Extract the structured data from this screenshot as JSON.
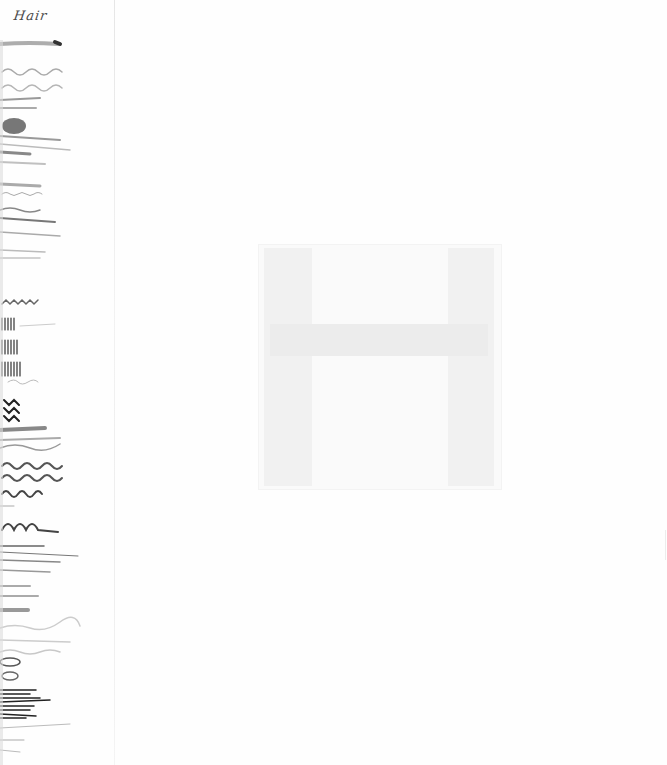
{
  "page": {
    "title": "Hair",
    "background_color": "#fefefe",
    "ink_color": "#4a4a4a"
  },
  "stroke_samples": {
    "label": "brush stroke samples",
    "count": 22,
    "types": [
      "straight",
      "wavy",
      "curly",
      "zigzag",
      "loops",
      "dense-vertical",
      "scribble"
    ]
  },
  "show_through": {
    "label": "faint H shape (reverse side bleed-through)",
    "color": "#f1f1f1"
  }
}
